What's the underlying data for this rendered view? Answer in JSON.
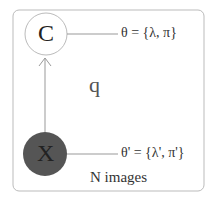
{
  "diagram": {
    "plate_label": "N images",
    "node_c": {
      "label": "C",
      "fill": "#ffffff",
      "stroke": "#bbbbbb"
    },
    "node_x": {
      "label": "X",
      "fill": "#555555",
      "stroke": "#555555"
    },
    "edge_label": "q",
    "param_c": "θ = {λ, π}",
    "param_x": "θ' = {λ', π'}",
    "colors": {
      "plate": "#bbbbbb",
      "edge": "#999999",
      "text": "#333333"
    }
  }
}
